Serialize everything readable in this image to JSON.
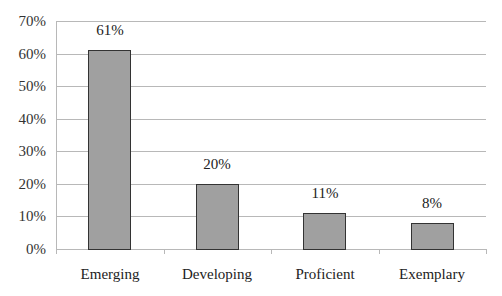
{
  "chart_data": {
    "type": "bar",
    "title": "",
    "xlabel": "",
    "ylabel": "",
    "categories": [
      "Emerging",
      "Developing",
      "Proficient",
      "Exemplary"
    ],
    "values": [
      61,
      20,
      11,
      8
    ],
    "value_labels": [
      "61%",
      "20%",
      "11%",
      "8%"
    ],
    "ylim": [
      0,
      70
    ],
    "yticks": [
      0,
      10,
      20,
      30,
      40,
      50,
      60,
      70
    ],
    "ytick_labels": [
      "0%",
      "10%",
      "20%",
      "30%",
      "40%",
      "50%",
      "60%",
      "70%"
    ],
    "grid": true,
    "legend": null,
    "bar_color": "#a0a0a0",
    "bar_edge_color": "#333333"
  }
}
